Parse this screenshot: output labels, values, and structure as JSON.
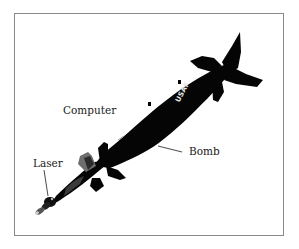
{
  "diagram": {
    "body_marking": "USAF",
    "labels": [
      {
        "id": "computer",
        "text": "Computer"
      },
      {
        "id": "bomb",
        "text": "Bomb"
      },
      {
        "id": "laser",
        "text": "Laser"
      }
    ],
    "colors": {
      "frame_border": "#8a8a8a",
      "bomb_body": "#050505",
      "label_text": "#1a1a1a",
      "marking_text": "#e8e8e8",
      "background": "#ffffff"
    }
  }
}
